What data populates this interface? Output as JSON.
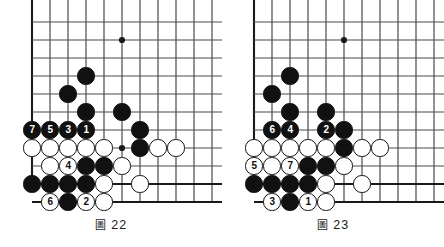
{
  "page": {
    "background": "#ffffff",
    "width": 444,
    "height": 247,
    "content_type": "go-game-diagram-pair"
  },
  "palette": {
    "black_stone": "#111111",
    "white_stone": "#ffffff",
    "stone_outline": "#111111",
    "grid_line": "#4a4a4a",
    "edge_line": "#1a1a1a",
    "caption_text": "#1a1a1a"
  },
  "figures": [
    {
      "id": "figure-22",
      "caption_glyph": "圖",
      "caption_number": "22",
      "caption_full": "圖 22",
      "board": {
        "cols": 11,
        "rows": 10,
        "cell": 18,
        "origin_x": 32,
        "origin_y": 22,
        "left_edge_col": 0,
        "bottom_edge_row": 9,
        "star_points": [
          {
            "col": 5,
            "row": 1
          },
          {
            "col": 11,
            "row": 1
          },
          {
            "col": 5,
            "row": 7
          }
        ]
      },
      "stones": [
        {
          "col": 3,
          "row": 3,
          "color": "black",
          "label": ""
        },
        {
          "col": 2,
          "row": 4,
          "color": "black",
          "label": ""
        },
        {
          "col": 3,
          "row": 5,
          "color": "black",
          "label": ""
        },
        {
          "col": 5,
          "row": 5,
          "color": "black",
          "label": ""
        },
        {
          "col": 0,
          "row": 6,
          "color": "black",
          "label": "7"
        },
        {
          "col": 1,
          "row": 6,
          "color": "black",
          "label": "5"
        },
        {
          "col": 2,
          "row": 6,
          "color": "black",
          "label": "3"
        },
        {
          "col": 3,
          "row": 6,
          "color": "black",
          "label": "1"
        },
        {
          "col": 6,
          "row": 6,
          "color": "black",
          "label": ""
        },
        {
          "col": 0,
          "row": 7,
          "color": "white",
          "label": ""
        },
        {
          "col": 1,
          "row": 7,
          "color": "white",
          "label": ""
        },
        {
          "col": 2,
          "row": 7,
          "color": "white",
          "label": ""
        },
        {
          "col": 3,
          "row": 7,
          "color": "white",
          "label": ""
        },
        {
          "col": 4,
          "row": 7,
          "color": "white",
          "label": ""
        },
        {
          "col": 6,
          "row": 7,
          "color": "black",
          "label": ""
        },
        {
          "col": 7,
          "row": 7,
          "color": "white",
          "label": ""
        },
        {
          "col": 8,
          "row": 7,
          "color": "white",
          "label": ""
        },
        {
          "col": 1,
          "row": 8,
          "color": "white",
          "label": ""
        },
        {
          "col": 2,
          "row": 8,
          "color": "white",
          "label": "4"
        },
        {
          "col": 3,
          "row": 8,
          "color": "black",
          "label": ""
        },
        {
          "col": 4,
          "row": 8,
          "color": "black",
          "label": ""
        },
        {
          "col": 5,
          "row": 8,
          "color": "white",
          "label": ""
        },
        {
          "col": 0,
          "row": 9,
          "color": "black",
          "label": ""
        },
        {
          "col": 1,
          "row": 9,
          "color": "black",
          "label": ""
        },
        {
          "col": 2,
          "row": 9,
          "color": "black",
          "label": ""
        },
        {
          "col": 3,
          "row": 9,
          "color": "black",
          "label": ""
        },
        {
          "col": 4,
          "row": 9,
          "color": "white",
          "label": ""
        },
        {
          "col": 6,
          "row": 9,
          "color": "white",
          "label": ""
        },
        {
          "col": 1,
          "row": 10,
          "color": "white",
          "label": "6"
        },
        {
          "col": 2,
          "row": 10,
          "color": "black",
          "label": ""
        },
        {
          "col": 3,
          "row": 10,
          "color": "white",
          "label": "2"
        },
        {
          "col": 4,
          "row": 10,
          "color": "white",
          "label": ""
        }
      ]
    },
    {
      "id": "figure-23",
      "caption_glyph": "圖",
      "caption_number": "23",
      "caption_full": "圖 23",
      "board": {
        "cols": 11,
        "rows": 10,
        "cell": 18,
        "origin_x": 32,
        "origin_y": 22,
        "left_edge_col": 0,
        "bottom_edge_row": 9,
        "star_points": [
          {
            "col": 5,
            "row": 1
          },
          {
            "col": 11,
            "row": 1
          },
          {
            "col": 11,
            "row": 7
          }
        ]
      },
      "stones": [
        {
          "col": 2,
          "row": 3,
          "color": "black",
          "label": ""
        },
        {
          "col": 1,
          "row": 4,
          "color": "black",
          "label": ""
        },
        {
          "col": 2,
          "row": 5,
          "color": "black",
          "label": ""
        },
        {
          "col": 4,
          "row": 5,
          "color": "black",
          "label": ""
        },
        {
          "col": 1,
          "row": 6,
          "color": "black",
          "label": "6"
        },
        {
          "col": 2,
          "row": 6,
          "color": "black",
          "label": "4"
        },
        {
          "col": 4,
          "row": 6,
          "color": "black",
          "label": "2"
        },
        {
          "col": 5,
          "row": 6,
          "color": "black",
          "label": ""
        },
        {
          "col": 0,
          "row": 7,
          "color": "white",
          "label": ""
        },
        {
          "col": 1,
          "row": 7,
          "color": "white",
          "label": ""
        },
        {
          "col": 2,
          "row": 7,
          "color": "white",
          "label": ""
        },
        {
          "col": 3,
          "row": 7,
          "color": "white",
          "label": ""
        },
        {
          "col": 4,
          "row": 7,
          "color": "white",
          "label": ""
        },
        {
          "col": 5,
          "row": 7,
          "color": "black",
          "label": ""
        },
        {
          "col": 6,
          "row": 7,
          "color": "white",
          "label": ""
        },
        {
          "col": 7,
          "row": 7,
          "color": "white",
          "label": ""
        },
        {
          "col": 0,
          "row": 8,
          "color": "white",
          "label": "5"
        },
        {
          "col": 1,
          "row": 8,
          "color": "white",
          "label": ""
        },
        {
          "col": 2,
          "row": 8,
          "color": "white",
          "label": "7"
        },
        {
          "col": 3,
          "row": 8,
          "color": "black",
          "label": ""
        },
        {
          "col": 4,
          "row": 8,
          "color": "black",
          "label": ""
        },
        {
          "col": 5,
          "row": 8,
          "color": "white",
          "label": ""
        },
        {
          "col": 0,
          "row": 9,
          "color": "black",
          "label": ""
        },
        {
          "col": 1,
          "row": 9,
          "color": "black",
          "label": ""
        },
        {
          "col": 2,
          "row": 9,
          "color": "black",
          "label": ""
        },
        {
          "col": 3,
          "row": 9,
          "color": "black",
          "label": ""
        },
        {
          "col": 4,
          "row": 9,
          "color": "white",
          "label": ""
        },
        {
          "col": 6,
          "row": 9,
          "color": "white",
          "label": ""
        },
        {
          "col": 1,
          "row": 10,
          "color": "white",
          "label": "3"
        },
        {
          "col": 2,
          "row": 10,
          "color": "black",
          "label": ""
        },
        {
          "col": 3,
          "row": 10,
          "color": "white",
          "label": "1"
        },
        {
          "col": 4,
          "row": 10,
          "color": "white",
          "label": ""
        }
      ]
    }
  ]
}
